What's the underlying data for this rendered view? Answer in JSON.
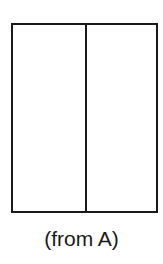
{
  "diagram": {
    "shape": "rectangle",
    "panels": [
      {
        "name": "left-panel"
      },
      {
        "name": "right-panel"
      }
    ],
    "stroke_color": "#1a1a1a",
    "background_color": "#ffffff"
  },
  "caption": {
    "text": "(from A)"
  }
}
